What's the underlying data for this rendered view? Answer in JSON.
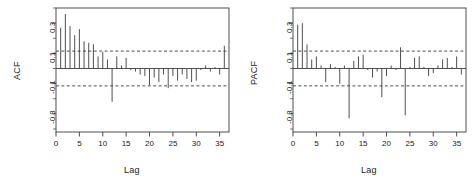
{
  "figure": {
    "background": "#ffffff",
    "foreground": "#3c3c3c",
    "panel_count": 2
  },
  "chart_data": [
    {
      "type": "bar",
      "title": "",
      "panel_name": "ACF",
      "xlabel": "Lag",
      "ylabel": "ACF",
      "xlim": [
        0,
        37
      ],
      "ylim": [
        -0.42,
        0.4
      ],
      "grid": false,
      "legend": null,
      "xticks": [
        0,
        5,
        10,
        15,
        20,
        25,
        30,
        35
      ],
      "xtick_labels": [
        "0",
        "5",
        "10",
        "15",
        "20",
        "25",
        "30",
        "35"
      ],
      "yticks": [
        -0.3,
        -0.1,
        0.1,
        0.3
      ],
      "ytick_labels": [
        "-0.3",
        "-0.1",
        "0.1",
        "0.3"
      ],
      "confidence_bounds": [
        0.115,
        -0.115
      ],
      "confidence_style": "dashed",
      "x": [
        1,
        2,
        3,
        4,
        5,
        6,
        7,
        8,
        9,
        10,
        11,
        12,
        13,
        14,
        15,
        16,
        17,
        18,
        19,
        20,
        21,
        22,
        23,
        24,
        25,
        26,
        27,
        28,
        29,
        30,
        31,
        32,
        33,
        34,
        35,
        36
      ],
      "values": [
        0.27,
        0.36,
        0.28,
        0.22,
        0.26,
        0.18,
        0.17,
        0.16,
        0.08,
        0.11,
        0.06,
        -0.22,
        0.08,
        0.02,
        0.07,
        -0.01,
        -0.02,
        -0.04,
        -0.05,
        -0.11,
        -0.06,
        -0.09,
        -0.04,
        -0.13,
        -0.05,
        -0.08,
        -0.04,
        -0.07,
        -0.09,
        -0.08,
        -0.01,
        0.02,
        -0.02,
        0.01,
        -0.04,
        0.15
      ]
    },
    {
      "type": "bar",
      "title": "",
      "panel_name": "PACF",
      "xlabel": "Lag",
      "ylabel": "PACF",
      "xlim": [
        0,
        37
      ],
      "ylim": [
        -0.42,
        0.4
      ],
      "grid": false,
      "legend": null,
      "xticks": [
        0,
        5,
        10,
        15,
        20,
        25,
        30,
        35
      ],
      "xtick_labels": [
        "0",
        "5",
        "10",
        "15",
        "20",
        "25",
        "30",
        "35"
      ],
      "yticks": [
        -0.3,
        -0.1,
        0.1,
        0.3
      ],
      "ytick_labels": [
        "-0.3",
        "-0.1",
        "0.1",
        "0.3"
      ],
      "confidence_bounds": [
        0.115,
        -0.115
      ],
      "confidence_style": "dashed",
      "x": [
        1,
        2,
        3,
        4,
        5,
        6,
        7,
        8,
        9,
        10,
        11,
        12,
        13,
        14,
        15,
        16,
        17,
        18,
        19,
        20,
        21,
        22,
        23,
        24,
        25,
        26,
        27,
        28,
        29,
        30,
        31,
        32,
        33,
        34,
        35,
        36
      ],
      "values": [
        0.29,
        0.3,
        0.16,
        0.06,
        0.08,
        0.02,
        -0.09,
        0.03,
        0.01,
        -0.1,
        0.02,
        -0.33,
        0.05,
        0.08,
        0.09,
        -0.01,
        -0.06,
        -0.02,
        -0.19,
        -0.05,
        0.02,
        -0.01,
        0.14,
        -0.31,
        0.01,
        0.07,
        0.08,
        0.01,
        -0.05,
        -0.03,
        0.02,
        0.06,
        0.07,
        0.01,
        0.08,
        -0.04
      ]
    }
  ]
}
